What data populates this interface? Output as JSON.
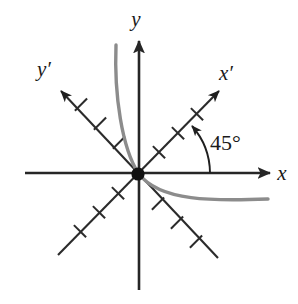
{
  "figure": {
    "type": "rotated-axes-conic-diagram",
    "background_color": "#ffffff",
    "axis_color": "#262626",
    "curve_color": "#8c8c8c",
    "origin_dot_color": "#111111",
    "labels": {
      "x_axis": "x",
      "y_axis": "y",
      "x_prime_axis": "x′",
      "y_prime_axis": "y′",
      "angle": "45°"
    },
    "geometry": {
      "origin": {
        "x": 138,
        "y": 174
      },
      "rotation_degrees": 45,
      "x_axis": {
        "start_x": 25,
        "end_x": 272,
        "y": 173
      },
      "y_axis": {
        "x": 139,
        "start_y": 290,
        "end_y": 38
      },
      "x_prime_axis": {
        "tip_x": 222,
        "tip_y": 88,
        "tail_x": 58,
        "tail_y": 255
      },
      "y_prime_axis": {
        "tip_x": 58,
        "tip_y": 88,
        "tail_x": 218,
        "tail_y": 258
      },
      "tick_count_per_ray": 3,
      "tick_spacing_px": 27,
      "tick_half_length_px": 9,
      "angle_arc_radius_px": 72
    },
    "curve": {
      "description": "parabola opening along the negative y-prime direction, vertex at origin",
      "start": {
        "x": 116,
        "y": 45
      },
      "vertex": {
        "x": 138,
        "y": 174
      },
      "end": {
        "x": 268,
        "y": 200
      }
    },
    "label_positions": {
      "x": {
        "x": 282,
        "y": 180
      },
      "y": {
        "x": 136,
        "y": 26
      },
      "x_prime": {
        "x": 226,
        "y": 80
      },
      "y_prime": {
        "x": 44,
        "y": 76
      },
      "angle": {
        "x": 210,
        "y": 150
      }
    }
  }
}
